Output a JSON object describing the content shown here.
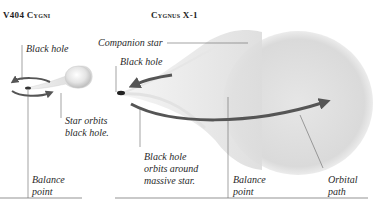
{
  "diagrams": [
    {
      "title": "V404 Cygni",
      "labels": {
        "black_hole": "Black hole",
        "star_orbits": "Star orbits\nblack hole.",
        "balance_point": "Balance\npoint"
      }
    },
    {
      "title": "Cygnus X-1",
      "labels": {
        "companion_star": "Companion star",
        "black_hole": "Black hole",
        "black_hole_orbits": "Black hole\norbits around\nmassive star.",
        "balance_point": "Balance\npoint",
        "orbital_path": "Orbital\npath"
      }
    }
  ],
  "colors": {
    "orbit_arrow": "#555555",
    "leader_line": "#555555",
    "star_fill": "#d8d8d8",
    "ground_line": "#666666"
  }
}
